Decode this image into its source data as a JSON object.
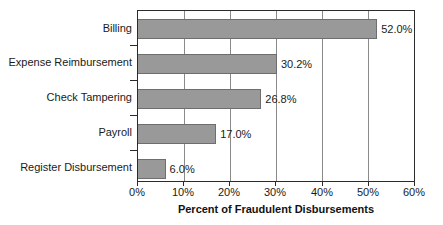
{
  "chart_data": {
    "type": "bar",
    "orientation": "horizontal",
    "title": "",
    "subtitle": "",
    "xlabel": "Percent of Fraudulent Disbursements",
    "ylabel": "",
    "xlim": [
      0,
      60
    ],
    "xtick_labels": [
      "0%",
      "10%",
      "20%",
      "30%",
      "40%",
      "50%",
      "60%"
    ],
    "xticks": [
      0,
      10,
      20,
      30,
      40,
      50,
      60
    ],
    "grid": true,
    "legend": false,
    "legend_position": "none",
    "categories": [
      "Billing",
      "Expense Reimbursement",
      "Check Tampering",
      "Payroll",
      "Register Disbursement"
    ],
    "values": [
      52.0,
      30.2,
      26.8,
      17.0,
      6.0
    ],
    "data_labels": [
      "52.0%",
      "30.2%",
      "26.8%",
      "17.0%",
      "6.0%"
    ],
    "bar_color": "#999999",
    "bar_edge_color": "#6e6e6e",
    "axis_color": "#2b2b2b",
    "grid_color": "#8a8a8a",
    "text_color": "#1a1a1a"
  }
}
